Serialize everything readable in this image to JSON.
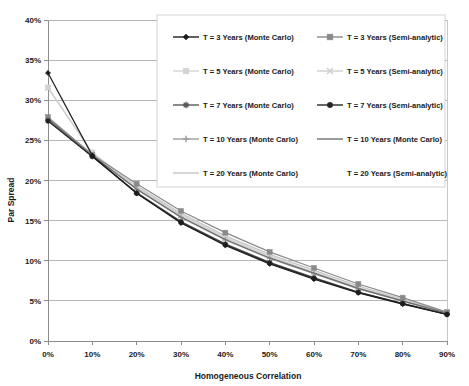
{
  "chart_data": {
    "type": "line",
    "title": "",
    "xlabel": "Homogeneous Correlation",
    "ylabel": "Par Spread",
    "xtick_labels": [
      "0%",
      "10%",
      "20%",
      "30%",
      "40%",
      "50%",
      "60%",
      "70%",
      "80%",
      "90%"
    ],
    "ytick_labels": [
      "0%",
      "5%",
      "10%",
      "15%",
      "20%",
      "25%",
      "30%",
      "35%",
      "40%"
    ],
    "x": [
      0,
      10,
      20,
      30,
      40,
      50,
      60,
      70,
      80,
      90
    ],
    "xlim": [
      0,
      90
    ],
    "ylim": [
      0,
      40
    ],
    "grid": "horizontal",
    "legend_position": "top-center-overlay",
    "series": [
      {
        "name": "T = 3 Years (Monte Carlo)",
        "marker": "diamond",
        "color": "#1d1d1d",
        "values": [
          33.4,
          23.1,
          18.4,
          14.7,
          11.9,
          9.6,
          7.7,
          6.0,
          4.6,
          3.3
        ]
      },
      {
        "name": "T = 3 Years (Semi-analytic)",
        "marker": "square",
        "color": "#8a8a8a",
        "values": [
          27.9,
          23.2,
          19.6,
          16.2,
          13.5,
          11.1,
          9.1,
          7.1,
          5.4,
          3.6
        ]
      },
      {
        "name": "T = 5 Years (Monte Carlo)",
        "marker": "square",
        "color": "#d4d4d4",
        "values": [
          31.6,
          23.5,
          19.2,
          15.7,
          12.9,
          10.6,
          8.6,
          6.7,
          5.1,
          3.5
        ]
      },
      {
        "name": "T = 5 Years (Semi-analytic)",
        "marker": "cross",
        "color": "#cfcfcf",
        "values": [
          31.5,
          23.4,
          19.1,
          15.6,
          12.8,
          10.5,
          8.5,
          6.6,
          5.0,
          3.5
        ]
      },
      {
        "name": "T = 7 Years (Monte Carlo)",
        "marker": "star",
        "color": "#5a5a5a",
        "values": [
          27.5,
          23.0,
          18.5,
          14.9,
          12.1,
          9.8,
          7.9,
          6.1,
          4.7,
          3.35
        ]
      },
      {
        "name": "T = 7 Years (Semi-analytic)",
        "marker": "circle",
        "color": "#262626",
        "values": [
          27.4,
          23.0,
          18.4,
          14.8,
          12.0,
          9.7,
          7.8,
          6.05,
          4.65,
          3.3
        ]
      },
      {
        "name": "T = 10 Years (Monte Carlo)",
        "marker": "plus",
        "color": "#9e9e9e",
        "values": [
          27.6,
          23.1,
          18.9,
          15.4,
          12.6,
          10.3,
          8.4,
          6.5,
          4.95,
          3.45
        ]
      },
      {
        "name": "T = 10 Years (Monte Carlo)",
        "marker": "line",
        "color": "#707070",
        "values": [
          27.7,
          23.15,
          18.95,
          15.45,
          12.65,
          10.35,
          8.45,
          6.55,
          5.0,
          3.48
        ]
      },
      {
        "name": "T = 20 Years (Monte Carlo)",
        "marker": "line",
        "color": "#c6c6c6",
        "values": [
          27.8,
          23.25,
          19.3,
          15.9,
          13.1,
          10.8,
          8.8,
          6.85,
          5.2,
          3.55
        ]
      },
      {
        "name": "T = 20 Years (Semi-analytic)",
        "marker": "none",
        "color": "#e6e6e6",
        "values": [
          27.8,
          23.25,
          19.3,
          15.9,
          13.1,
          10.8,
          8.8,
          6.85,
          5.2,
          3.55
        ]
      }
    ]
  },
  "axes": {
    "y_title": "Par Spread",
    "x_title": "Homogeneous Correlation"
  },
  "legend": {
    "entries": [
      {
        "label": "T = 3 Years (Monte Carlo)",
        "marker": "diamond",
        "color": "#1d1d1d"
      },
      {
        "label": "T = 3 Years (Semi-analytic)",
        "marker": "square",
        "color": "#8a8a8a"
      },
      {
        "label": "T = 5 Years (Monte Carlo)",
        "marker": "square",
        "color": "#d4d4d4"
      },
      {
        "label": "T = 5 Years (Semi-analytic)",
        "marker": "cross",
        "color": "#cfcfcf"
      },
      {
        "label": "T = 7 Years (Monte Carlo)",
        "marker": "star",
        "color": "#5a5a5a"
      },
      {
        "label": "T = 7 Years (Semi-analytic)",
        "marker": "circle",
        "color": "#262626"
      },
      {
        "label": "T = 10 Years (Monte Carlo)",
        "marker": "plus",
        "color": "#9e9e9e"
      },
      {
        "label": "T = 10 Years (Monte Carlo)",
        "marker": "line",
        "color": "#707070"
      },
      {
        "label": "T = 20 Years (Monte Carlo)",
        "marker": "line",
        "color": "#c6c6c6"
      },
      {
        "label": "T = 20 Years (Semi-analytic)",
        "marker": "none",
        "color": "#e6e6e6"
      }
    ]
  },
  "colors": {
    "plot_border": "#b0b0b0",
    "gridline": "#9a9a9a",
    "axis_line": "#8c8c8c",
    "legend_border": "#c8c8c8",
    "background": "#ffffff",
    "text": "#1a1a1a"
  }
}
